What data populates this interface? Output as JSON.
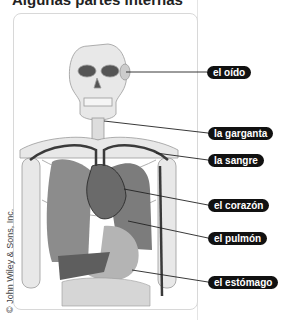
{
  "title": "Algunas partes internas",
  "credit": "© John Wiley & Sons, Inc.",
  "labels": [
    {
      "id": "ear",
      "text": "el oído",
      "x": 207,
      "y": 66
    },
    {
      "id": "throat",
      "text": "la garganta",
      "x": 208,
      "y": 127
    },
    {
      "id": "blood",
      "text": "la sangre",
      "x": 208,
      "y": 154
    },
    {
      "id": "heart",
      "text": "el corazón",
      "x": 208,
      "y": 199
    },
    {
      "id": "lung",
      "text": "el pulmón",
      "x": 208,
      "y": 232
    },
    {
      "id": "stomach",
      "text": "el estómago",
      "x": 208,
      "y": 276
    }
  ],
  "colors": {
    "pill_bg": "#111111",
    "pill_text": "#ffffff",
    "bone": "#e6e6e6",
    "organ": "#8a8a8a",
    "vessel": "#3a3a3a"
  }
}
